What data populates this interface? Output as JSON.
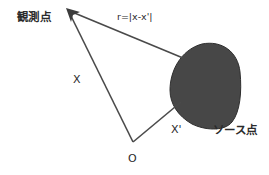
{
  "diagram": {
    "labels": {
      "observation_point": "観測点",
      "distance_formula": "r=|x-x'|",
      "position_vector": "X",
      "source_vector": "X'",
      "source_point": "ソース点",
      "origin": "O"
    },
    "colors": {
      "line": "#4a4a4a",
      "source_fill": "#474747",
      "source_stroke": "#2e2e2e",
      "text": "#2b2b2b",
      "background": "#ffffff"
    }
  }
}
